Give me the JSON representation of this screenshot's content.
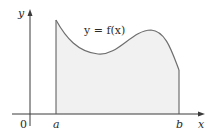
{
  "figure": {
    "curve_label": "y = f(x)",
    "axis_labels": {
      "x": "x",
      "y": "y",
      "origin": "0"
    },
    "bounds": {
      "a": "a",
      "b": "b"
    }
  },
  "colors": {
    "axis": "#3a3a3a",
    "curve": "#6e6e6e",
    "fill": "#f1f1f1",
    "text": "#2a2a2a"
  }
}
